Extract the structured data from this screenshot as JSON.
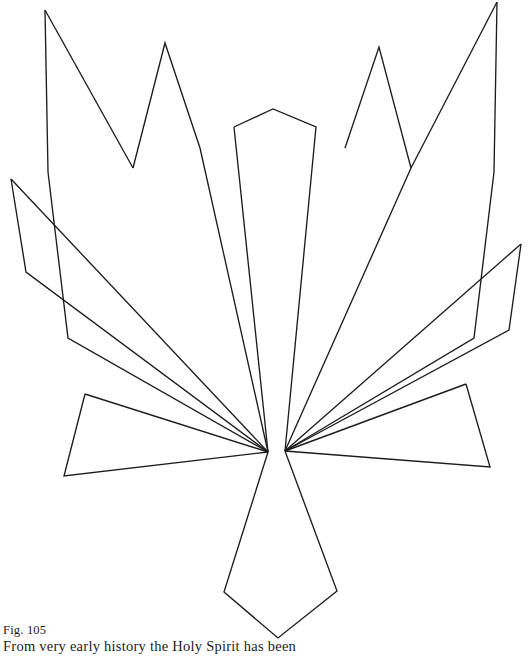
{
  "page": {
    "background_color": "#ffffff",
    "ink_color": "#1c1c1c",
    "width": 532,
    "height": 658
  },
  "caption": {
    "figure_number": "Fig. 105",
    "text": "From very early history the Holy Spirit has been"
  },
  "figure": {
    "title": "Fig. 105",
    "stroke_color": "#1c1c1c",
    "stroke_width": 1.35,
    "fill": "none",
    "symmetry": "bilateral, mirrored about the vertical centre line",
    "convergence_points": [
      {
        "name": "left-node",
        "x": 268,
        "y": 452
      },
      {
        "name": "right-node",
        "x": 285,
        "y": 451
      }
    ],
    "shapes": [
      {
        "name": "head-kite",
        "kind": "open-polyline",
        "points": "234,127 273,109 316,127 285,451"
      },
      {
        "name": "head-kite-left-edge",
        "kind": "open-polyline",
        "points": "234,127 268,452"
      },
      {
        "name": "left-outer-spike",
        "kind": "open-polyline",
        "points": "45,10 48,172 68,338 268,452"
      },
      {
        "name": "left-outer-spike-inner-edge",
        "kind": "open-polyline",
        "points": "45,10 133,168"
      },
      {
        "name": "left-inner-spike",
        "kind": "open-polyline",
        "points": "133,168 165,43 200,148 268,452"
      },
      {
        "name": "right-inner-spike",
        "kind": "open-polyline",
        "points": "345,148 379,47 411,168 285,451"
      },
      {
        "name": "right-outer-spike",
        "kind": "open-polyline",
        "points": "497,2 494,172 474,338 285,451"
      },
      {
        "name": "right-outer-spike-inner-edge",
        "kind": "open-polyline",
        "points": "497,2 411,168"
      },
      {
        "name": "left-wing-band",
        "kind": "open-polyline",
        "points": "11,179 26,272 268,452"
      },
      {
        "name": "left-wing-band-upper-edge",
        "kind": "open-polyline",
        "points": "11,179 268,452"
      },
      {
        "name": "right-wing-band",
        "kind": "open-polyline",
        "points": "521,244 509,330 285,451"
      },
      {
        "name": "right-wing-band-upper-edge",
        "kind": "open-polyline",
        "points": "521,244 285,451"
      },
      {
        "name": "left-lower-wing-quad",
        "kind": "open-polyline",
        "points": "85,394 64,476 268,452"
      },
      {
        "name": "left-lower-wing-quad-top",
        "kind": "open-polyline",
        "points": "85,394 268,452"
      },
      {
        "name": "right-lower-wing-quad",
        "kind": "open-polyline",
        "points": "466,384 490,467 285,451"
      },
      {
        "name": "right-lower-wing-quad-top",
        "kind": "open-polyline",
        "points": "466,384 285,451"
      },
      {
        "name": "tail",
        "kind": "open-polyline",
        "points": "268,452 224,592 278,638 337,591 285,451"
      }
    ]
  }
}
